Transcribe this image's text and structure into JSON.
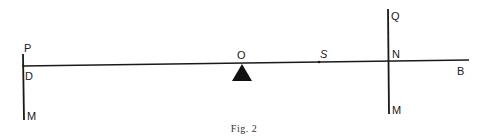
{
  "figure": {
    "caption": "Fig. 2",
    "type": "lever diagram",
    "labels": {
      "P": "P",
      "D": "D",
      "M_left": "M",
      "O": "O",
      "S": "S",
      "Q": "Q",
      "N": "N",
      "B": "B",
      "M_right": "M"
    },
    "elements": [
      {
        "name": "lever-beam",
        "from": "D",
        "to": "B"
      },
      {
        "name": "left-force-line",
        "from": "P",
        "to": "M",
        "through": "D"
      },
      {
        "name": "fulcrum",
        "at": "O"
      },
      {
        "name": "point-s",
        "at": "S"
      },
      {
        "name": "right-force-line",
        "from": "Q",
        "to": "M",
        "through": "N"
      }
    ],
    "colors": {
      "ink": "#1a1a1a",
      "background": "#ffffff"
    }
  }
}
